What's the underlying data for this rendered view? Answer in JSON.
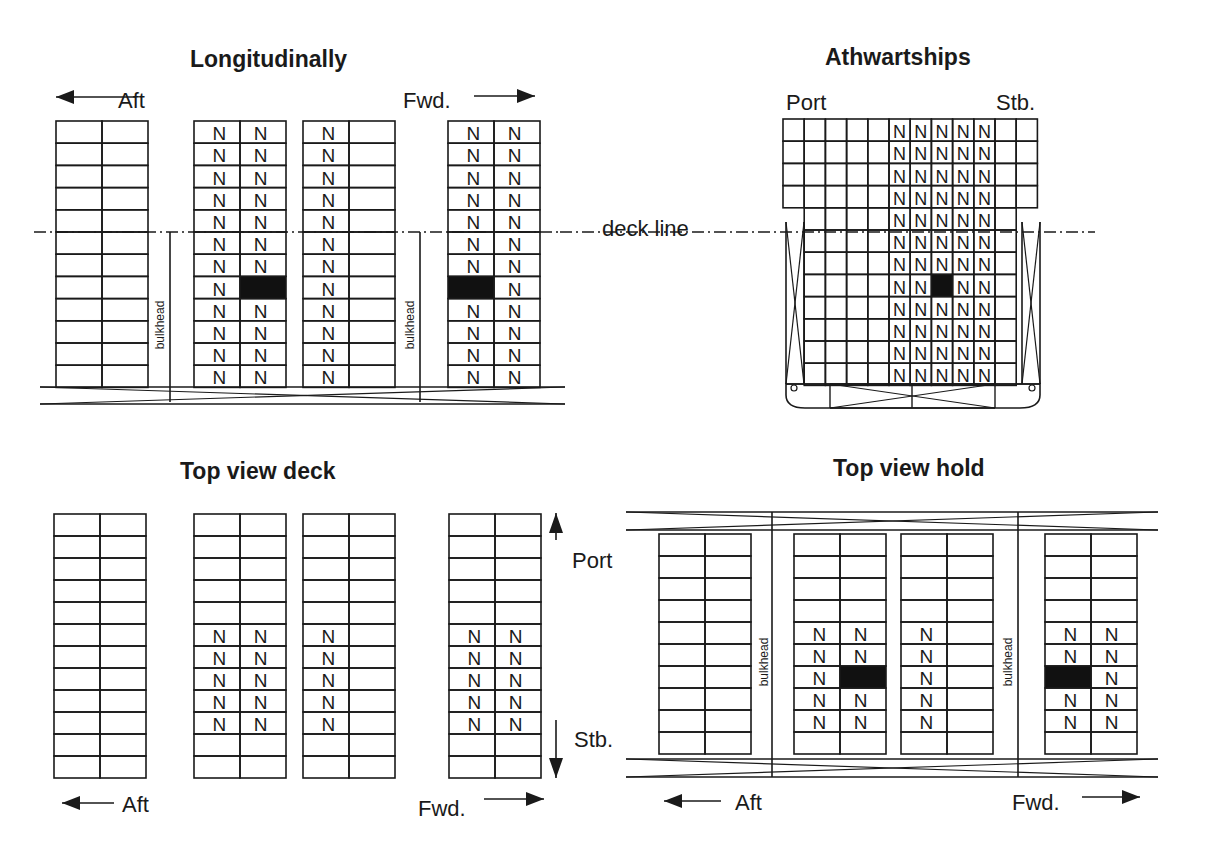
{
  "titles": {
    "longitudinal": "Longitudinally",
    "athwartships": "Athwartships",
    "top_deck": "Top view deck",
    "top_hold": "Top view hold"
  },
  "labels": {
    "aft": "Aft",
    "fwd": "Fwd.",
    "port": "Port",
    "stb": "Stb.",
    "deck_line": "deck line",
    "bulkhead": "bulkhead"
  },
  "marker": "N",
  "colors": {
    "line": "#1a1a1a",
    "blocked": "#111111",
    "background": "#ffffff"
  },
  "longitudinal": {
    "rows": 12,
    "stacks": [
      {
        "x": 56,
        "n_cols": [],
        "black": []
      },
      {
        "x": 194,
        "n_cols": [
          0,
          1
        ],
        "black": [
          [
            7,
            1
          ]
        ]
      },
      {
        "x": 303,
        "n_cols": [
          0
        ],
        "black": []
      },
      {
        "x": 448,
        "n_cols": [
          0,
          1
        ],
        "black": [
          [
            7,
            0
          ]
        ]
      }
    ]
  },
  "athwartships": {
    "cols": 12,
    "rows": 12,
    "n_cols": [
      5,
      6,
      7,
      8,
      9
    ],
    "black": [
      [
        7,
        7
      ]
    ]
  },
  "top_deck": {
    "rows": 12,
    "n_rows": [
      5,
      6,
      7,
      8,
      9
    ],
    "stacks": [
      {
        "x": 54,
        "n_cols": []
      },
      {
        "x": 194,
        "n_cols": [
          0,
          1
        ]
      },
      {
        "x": 303,
        "n_cols": [
          0
        ]
      },
      {
        "x": 449,
        "n_cols": [
          0,
          1
        ]
      }
    ]
  },
  "top_hold": {
    "rows": 10,
    "n_rows": [
      4,
      5,
      6,
      7,
      8
    ],
    "stacks": [
      {
        "x": 659,
        "n_cols": [],
        "black": []
      },
      {
        "x": 794,
        "n_cols": [
          0,
          1
        ],
        "black": [
          [
            6,
            1
          ]
        ]
      },
      {
        "x": 901,
        "n_cols": [
          0
        ],
        "black": []
      },
      {
        "x": 1045,
        "n_cols": [
          0,
          1
        ],
        "black": [
          [
            6,
            0
          ]
        ]
      }
    ]
  }
}
